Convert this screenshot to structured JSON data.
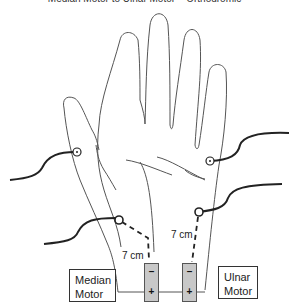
{
  "title": "Median Motor to Ulnar Motor – Orthodromic",
  "distances": {
    "median": "7 cm",
    "ulnar": "7 cm"
  },
  "recording_boxes": {
    "median": {
      "line1": "Median",
      "line2": "Motor"
    },
    "ulnar": {
      "line1": "Ulnar",
      "line2": "Motor"
    }
  },
  "electrodes": {
    "median": {
      "top": "–",
      "bottom": "+"
    },
    "ulnar": {
      "top": "–",
      "bottom": "+"
    }
  },
  "colors": {
    "outline": "#555555",
    "lead_wire": "#222222",
    "electrode_fill": "#c8c8c8"
  }
}
